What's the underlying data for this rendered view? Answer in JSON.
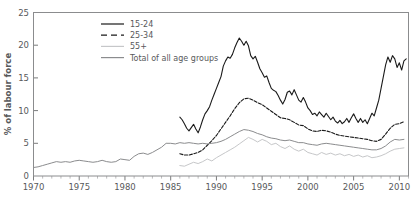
{
  "chart_data": {
    "type": "line",
    "title": "",
    "xlabel": "",
    "ylabel": "% of labour force",
    "xlim": [
      1970,
      2011
    ],
    "ylim": [
      0,
      25
    ],
    "yticks": [
      0,
      5,
      10,
      15,
      20,
      25
    ],
    "xticks": [
      1970,
      1975,
      1980,
      1985,
      1990,
      1995,
      2000,
      2005,
      2010
    ],
    "xtick_labels": [
      "1970",
      "1975",
      "1980",
      "1985",
      "1990",
      "1995",
      "2000",
      "2005",
      "2010"
    ],
    "ytick_labels": [
      "0",
      "5",
      "10",
      "15",
      "20",
      "25"
    ],
    "minor_xtick_interval": 1,
    "grid": false,
    "legend_position": "top-center",
    "series": [
      {
        "name": "15-24",
        "color": "#1a1a1a",
        "style": "solid",
        "width": 1.1,
        "x": [
          1986.0,
          1986.25,
          1986.5,
          1986.75,
          1987.0,
          1987.25,
          1987.5,
          1987.75,
          1988.0,
          1988.25,
          1988.5,
          1988.75,
          1989.0,
          1989.25,
          1989.5,
          1989.75,
          1990.0,
          1990.25,
          1990.5,
          1990.75,
          1991.0,
          1991.25,
          1991.5,
          1991.75,
          1992.0,
          1992.25,
          1992.5,
          1992.75,
          1993.0,
          1993.25,
          1993.5,
          1993.75,
          1994.0,
          1994.25,
          1994.5,
          1994.75,
          1995.0,
          1995.25,
          1995.5,
          1995.75,
          1996.0,
          1996.25,
          1996.5,
          1996.75,
          1997.0,
          1997.25,
          1997.5,
          1997.75,
          1998.0,
          1998.25,
          1998.5,
          1998.75,
          1999.0,
          1999.25,
          1999.5,
          1999.75,
          2000.0,
          2000.25,
          2000.5,
          2000.75,
          2001.0,
          2001.25,
          2001.5,
          2001.75,
          2002.0,
          2002.25,
          2002.5,
          2002.75,
          2003.0,
          2003.25,
          2003.5,
          2003.75,
          2004.0,
          2004.25,
          2004.5,
          2004.75,
          2005.0,
          2005.25,
          2005.5,
          2005.75,
          2006.0,
          2006.25,
          2006.5,
          2006.75,
          2007.0,
          2007.25,
          2007.5,
          2007.75,
          2008.0,
          2008.25,
          2008.5,
          2008.75,
          2009.0,
          2009.25,
          2009.5,
          2009.75,
          2010.0,
          2010.25,
          2010.5,
          2010.75
        ],
        "y": [
          9.0,
          8.6,
          8.0,
          7.3,
          6.9,
          7.4,
          7.9,
          7.2,
          6.6,
          7.5,
          8.6,
          9.5,
          10.0,
          10.6,
          11.6,
          12.5,
          13.4,
          14.3,
          15.2,
          16.8,
          17.6,
          18.2,
          18.0,
          18.6,
          19.6,
          20.4,
          21.1,
          20.6,
          20.0,
          20.6,
          19.9,
          18.4,
          17.9,
          18.3,
          17.4,
          16.4,
          15.8,
          15.1,
          15.3,
          14.3,
          13.4,
          13.1,
          12.9,
          12.3,
          11.6,
          11.0,
          11.7,
          12.8,
          13.0,
          12.4,
          13.2,
          12.4,
          11.6,
          11.3,
          12.0,
          11.3,
          10.4,
          10.0,
          9.4,
          9.6,
          9.2,
          9.8,
          9.4,
          9.0,
          9.6,
          9.1,
          8.6,
          9.0,
          8.4,
          8.1,
          8.5,
          8.0,
          8.3,
          8.8,
          8.2,
          8.9,
          9.5,
          8.8,
          8.2,
          8.8,
          8.2,
          8.6,
          8.0,
          8.8,
          9.6,
          9.2,
          10.4,
          11.6,
          13.4,
          15.2,
          17.0,
          18.2,
          17.4,
          18.4,
          17.9,
          16.6,
          17.3,
          16.2,
          17.6,
          17.9
        ]
      },
      {
        "name": "25-34",
        "color": "#1a1a1a",
        "style": "dashed",
        "width": 1.1,
        "x": [
          1986.0,
          1986.5,
          1987.0,
          1987.5,
          1988.0,
          1988.5,
          1989.0,
          1989.5,
          1990.0,
          1990.5,
          1991.0,
          1991.5,
          1992.0,
          1992.5,
          1993.0,
          1993.5,
          1994.0,
          1994.5,
          1995.0,
          1995.5,
          1996.0,
          1996.5,
          1997.0,
          1997.5,
          1998.0,
          1998.5,
          1999.0,
          1999.5,
          2000.0,
          2000.5,
          2001.0,
          2001.5,
          2002.0,
          2002.5,
          2003.0,
          2003.5,
          2004.0,
          2004.5,
          2005.0,
          2005.5,
          2006.0,
          2006.5,
          2007.0,
          2007.5,
          2008.0,
          2008.5,
          2009.0,
          2009.5,
          2010.0,
          2010.5
        ],
        "y": [
          3.4,
          3.2,
          3.2,
          3.4,
          3.6,
          4.0,
          4.7,
          5.4,
          6.2,
          7.2,
          8.2,
          9.2,
          10.3,
          11.2,
          11.8,
          11.9,
          11.6,
          11.2,
          10.9,
          10.4,
          9.9,
          9.4,
          8.9,
          8.8,
          8.6,
          8.2,
          7.8,
          7.7,
          7.2,
          6.9,
          6.8,
          7.0,
          6.9,
          6.7,
          6.4,
          6.2,
          6.1,
          6.0,
          5.9,
          5.8,
          5.7,
          5.6,
          5.4,
          5.3,
          5.6,
          6.4,
          7.3,
          7.9,
          8.0,
          8.3
        ]
      },
      {
        "name": "55+",
        "color": "#c6c7c9",
        "style": "solid",
        "width": 1.0,
        "x": [
          1986.0,
          1986.5,
          1987.0,
          1987.5,
          1988.0,
          1988.5,
          1989.0,
          1989.5,
          1990.0,
          1990.5,
          1991.0,
          1991.5,
          1992.0,
          1992.5,
          1993.0,
          1993.5,
          1994.0,
          1994.5,
          1995.0,
          1995.5,
          1996.0,
          1996.5,
          1997.0,
          1997.5,
          1998.0,
          1998.5,
          1999.0,
          1999.5,
          2000.0,
          2000.5,
          2001.0,
          2001.5,
          2002.0,
          2002.5,
          2003.0,
          2003.5,
          2004.0,
          2004.5,
          2005.0,
          2005.5,
          2006.0,
          2006.5,
          2007.0,
          2007.5,
          2008.0,
          2008.5,
          2009.0,
          2009.5,
          2010.0,
          2010.5
        ],
        "y": [
          1.6,
          1.5,
          1.8,
          2.1,
          1.9,
          2.2,
          2.6,
          2.3,
          2.8,
          3.2,
          3.6,
          4.0,
          4.4,
          4.9,
          5.4,
          5.9,
          5.6,
          5.2,
          5.6,
          5.3,
          4.8,
          5.0,
          4.5,
          4.2,
          4.6,
          4.1,
          3.8,
          4.1,
          3.6,
          3.4,
          3.2,
          3.6,
          3.3,
          3.5,
          3.2,
          3.4,
          3.1,
          3.3,
          3.0,
          3.2,
          2.9,
          3.1,
          2.8,
          2.9,
          3.1,
          3.4,
          3.8,
          4.1,
          4.2,
          4.3
        ]
      },
      {
        "name": "Total of all age groups",
        "color": "#8b8c8e",
        "style": "solid",
        "width": 1.0,
        "x": [
          1970.0,
          1970.5,
          1971.0,
          1971.5,
          1972.0,
          1972.5,
          1973.0,
          1973.5,
          1974.0,
          1974.5,
          1975.0,
          1975.5,
          1976.0,
          1976.5,
          1977.0,
          1977.5,
          1978.0,
          1978.5,
          1979.0,
          1979.5,
          1980.0,
          1980.5,
          1981.0,
          1981.5,
          1982.0,
          1982.5,
          1983.0,
          1983.5,
          1984.0,
          1984.5,
          1985.0,
          1985.5,
          1986.0,
          1986.5,
          1987.0,
          1987.5,
          1988.0,
          1988.5,
          1989.0,
          1989.5,
          1990.0,
          1990.5,
          1991.0,
          1991.5,
          1992.0,
          1992.5,
          1993.0,
          1993.5,
          1994.0,
          1994.5,
          1995.0,
          1995.5,
          1996.0,
          1996.5,
          1997.0,
          1997.5,
          1998.0,
          1998.5,
          1999.0,
          1999.5,
          2000.0,
          2000.5,
          2001.0,
          2001.5,
          2002.0,
          2002.5,
          2003.0,
          2003.5,
          2004.0,
          2004.5,
          2005.0,
          2005.5,
          2006.0,
          2006.5,
          2007.0,
          2007.5,
          2008.0,
          2008.5,
          2009.0,
          2009.5,
          2010.0,
          2010.5
        ],
        "y": [
          1.3,
          1.4,
          1.6,
          1.8,
          2.0,
          2.2,
          2.1,
          2.2,
          2.1,
          2.3,
          2.4,
          2.3,
          2.2,
          2.1,
          2.2,
          2.4,
          2.2,
          2.1,
          2.2,
          2.6,
          2.5,
          2.4,
          3.0,
          3.4,
          3.5,
          3.3,
          3.6,
          4.0,
          4.4,
          5.0,
          5.0,
          4.9,
          5.1,
          5.0,
          5.1,
          5.0,
          4.9,
          5.0,
          4.9,
          5.0,
          5.1,
          5.3,
          5.6,
          6.0,
          6.4,
          6.8,
          7.1,
          7.0,
          6.8,
          6.5,
          6.3,
          6.0,
          5.8,
          5.7,
          5.5,
          5.4,
          5.5,
          5.3,
          5.1,
          5.1,
          4.9,
          4.8,
          4.7,
          4.9,
          5.0,
          4.9,
          4.8,
          4.7,
          4.6,
          4.5,
          4.4,
          4.3,
          4.2,
          4.1,
          4.0,
          4.0,
          4.2,
          4.6,
          5.2,
          5.6,
          5.5,
          5.6
        ]
      }
    ],
    "legend": [
      {
        "label": "15-24",
        "color": "#1a1a1a",
        "style": "solid"
      },
      {
        "label": "25-34",
        "color": "#1a1a1a",
        "style": "dashed"
      },
      {
        "label": "55+",
        "color": "#c6c7c9",
        "style": "solid"
      },
      {
        "label": "Total of all age groups",
        "color": "#8b8c8e",
        "style": "solid"
      }
    ]
  },
  "axes": {
    "y_title": "% of labour force"
  },
  "colors": {
    "frame": "#8b8c8e",
    "text": "#58595b",
    "series_dark": "#1a1a1a",
    "series_light_gray": "#c6c7c9",
    "series_mid_gray": "#8b8c8e",
    "background": "#ffffff"
  }
}
